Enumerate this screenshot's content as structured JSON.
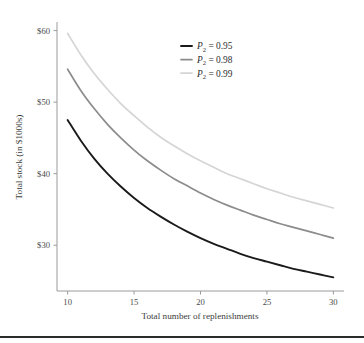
{
  "chart_data": {
    "type": "line",
    "title": "",
    "xlabel": "Total number of replenishments",
    "ylabel": "Total stock (in $1000s)",
    "xlim": [
      9.2,
      30.8
    ],
    "ylim": [
      23.6,
      61.2
    ],
    "xticks": [
      10,
      15,
      20,
      25,
      30
    ],
    "xticklabels": [
      "10",
      "15",
      "20",
      "25",
      "30"
    ],
    "yticks": [
      30,
      40,
      50,
      60
    ],
    "yticklabels": [
      "$30",
      "$40",
      "$50",
      "$60"
    ],
    "grid": false,
    "legend_position": "upper right",
    "x": [
      10,
      11,
      12,
      13,
      14,
      15,
      16,
      17,
      18,
      19,
      20,
      21,
      22,
      23,
      24,
      25,
      26,
      27,
      28,
      29,
      30
    ],
    "series": [
      {
        "name": "P_2 = 0.95",
        "label_main": "P",
        "label_sub": "2",
        "label_rest": " = 0.95",
        "color": "#1a1a1a",
        "width": 1.9,
        "values": [
          47.5,
          44.6,
          42.1,
          40.0,
          38.2,
          36.6,
          35.2,
          34.0,
          32.9,
          31.9,
          31.0,
          30.2,
          29.5,
          28.8,
          28.2,
          27.7,
          27.2,
          26.7,
          26.3,
          25.9,
          25.5
        ]
      },
      {
        "name": "P_2 = 0.98",
        "label_main": "P",
        "label_sub": "2",
        "label_rest": " = 0.98",
        "color": "#8c8c8c",
        "width": 1.7,
        "values": [
          54.6,
          51.6,
          49.1,
          46.9,
          45.0,
          43.3,
          41.8,
          40.5,
          39.3,
          38.3,
          37.3,
          36.4,
          35.6,
          34.9,
          34.2,
          33.6,
          33.0,
          32.5,
          32.0,
          31.5,
          31.0
        ]
      },
      {
        "name": "P_2 = 0.99",
        "label_main": "P",
        "label_sub": "2",
        "label_rest": " = 0.99",
        "color": "#d5d5d5",
        "width": 1.7,
        "values": [
          59.6,
          56.6,
          54.0,
          51.8,
          49.8,
          48.1,
          46.5,
          45.1,
          43.9,
          42.8,
          41.8,
          40.9,
          40.0,
          39.3,
          38.6,
          37.9,
          37.3,
          36.7,
          36.2,
          35.7,
          35.2
        ]
      }
    ]
  },
  "figure": {
    "background": "#ffffff",
    "spine_color": "#9a9a9a",
    "bottom_rule_color": "#2b2b2b"
  }
}
